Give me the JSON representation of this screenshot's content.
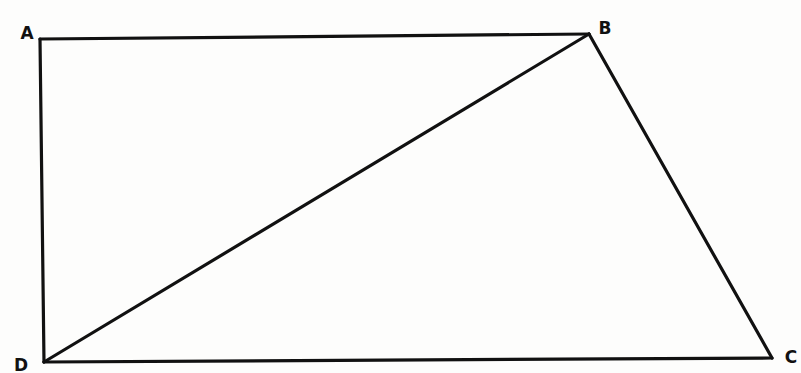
{
  "figure": {
    "type": "quadrilateral-with-diagonal",
    "stroke_color": "#111111",
    "background": "#fdfdfc",
    "vertices": {
      "A": {
        "label": "A",
        "x": 40,
        "y": 39,
        "label_x": 27,
        "label_y": 33
      },
      "B": {
        "label": "B",
        "x": 589,
        "y": 34,
        "label_x": 605,
        "label_y": 28
      },
      "C": {
        "label": "C",
        "x": 772,
        "y": 358,
        "label_x": 791,
        "label_y": 357
      },
      "D": {
        "label": "D",
        "x": 44,
        "y": 362,
        "label_x": 21,
        "label_y": 365
      }
    },
    "edges": [
      {
        "name": "AB",
        "from": "A",
        "to": "B"
      },
      {
        "name": "BC",
        "from": "B",
        "to": "C"
      },
      {
        "name": "CD",
        "from": "C",
        "to": "D"
      },
      {
        "name": "DA",
        "from": "D",
        "to": "A"
      },
      {
        "name": "DB",
        "from": "D",
        "to": "B",
        "diagonal": true
      }
    ]
  }
}
